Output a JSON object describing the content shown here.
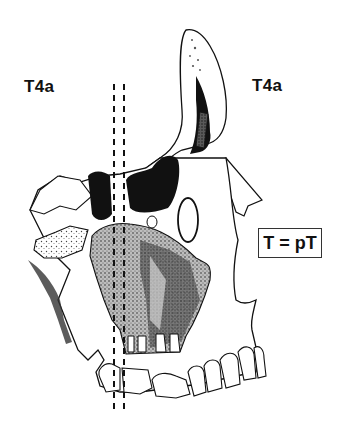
{
  "figure": {
    "labels": {
      "left_stage": "T4a",
      "right_stage": "T4a",
      "equation_box": "T = pT"
    },
    "resection_lines": {
      "style": "dashed",
      "count": 2,
      "orientation": "vertical"
    },
    "colors": {
      "background": "#ffffff",
      "ink": "#111111",
      "box_border": "#333333"
    }
  }
}
